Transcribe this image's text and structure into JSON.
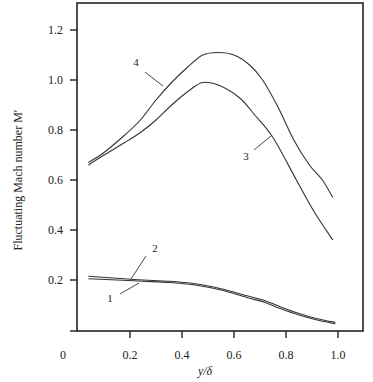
{
  "chart_data": {
    "type": "line",
    "title": "",
    "xlabel": "y/δ",
    "ylabel": "Fluctuating Mach number M′",
    "xlim": [
      0,
      1.1
    ],
    "ylim": [
      0,
      1.3
    ],
    "grid": false,
    "legend": "none (curves labeled inline with numbers 1–4)",
    "x_ticks": [
      "0",
      "0.2",
      "0.4",
      "0.6",
      "0.8",
      "1.0"
    ],
    "y_ticks": [
      "0.2",
      "0.4",
      "0.6",
      "0.8",
      "1.0",
      "1.2"
    ],
    "series": [
      {
        "name": "1",
        "x": [
          0.04,
          0.15,
          0.25,
          0.35,
          0.45,
          0.55,
          0.65,
          0.72,
          0.78,
          0.85,
          0.92,
          0.99
        ],
        "y": [
          0.205,
          0.2,
          0.195,
          0.19,
          0.18,
          0.16,
          0.13,
          0.11,
          0.085,
          0.06,
          0.04,
          0.025
        ]
      },
      {
        "name": "2",
        "x": [
          0.04,
          0.15,
          0.25,
          0.35,
          0.45,
          0.55,
          0.65,
          0.72,
          0.78,
          0.85,
          0.92,
          0.99
        ],
        "y": [
          0.215,
          0.207,
          0.2,
          0.195,
          0.185,
          0.165,
          0.137,
          0.117,
          0.092,
          0.066,
          0.045,
          0.03
        ]
      },
      {
        "name": "3",
        "x": [
          0.04,
          0.1,
          0.18,
          0.24,
          0.3,
          0.36,
          0.43,
          0.48,
          0.54,
          0.62,
          0.68,
          0.75,
          0.84,
          0.91,
          0.98
        ],
        "y": [
          0.66,
          0.7,
          0.75,
          0.79,
          0.84,
          0.9,
          0.96,
          0.99,
          0.98,
          0.93,
          0.86,
          0.77,
          0.6,
          0.47,
          0.36
        ]
      },
      {
        "name": "4",
        "x": [
          0.04,
          0.1,
          0.18,
          0.24,
          0.3,
          0.36,
          0.42,
          0.48,
          0.54,
          0.6,
          0.66,
          0.71,
          0.77,
          0.83,
          0.89,
          0.94,
          0.98
        ],
        "y": [
          0.67,
          0.71,
          0.78,
          0.84,
          0.92,
          0.99,
          1.05,
          1.1,
          1.11,
          1.1,
          1.06,
          1.0,
          0.89,
          0.76,
          0.66,
          0.6,
          0.53
        ]
      }
    ],
    "annotations": [
      {
        "text": "1",
        "series": "1"
      },
      {
        "text": "2",
        "series": "2"
      },
      {
        "text": "3",
        "series": "3"
      },
      {
        "text": "4",
        "series": "4"
      }
    ]
  },
  "labels": {
    "x_axis_title": "y/δ",
    "y_axis_title": "Fluctuating Mach number M′",
    "zero": "0"
  }
}
